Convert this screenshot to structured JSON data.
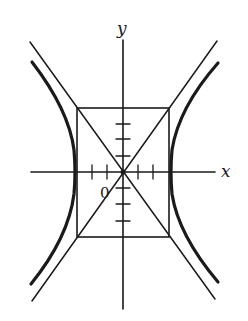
{
  "diagram": {
    "title": "",
    "colors": {
      "stroke": "#1a1a1a",
      "background": "#ffffff"
    },
    "labels": {
      "x_axis": "x",
      "y_axis": "y",
      "origin": "0"
    },
    "origin": {
      "x": 123,
      "y": 172
    },
    "x_axis": {
      "x1": 31,
      "x2": 215,
      "y": 172
    },
    "y_axis": {
      "x": 123,
      "y1": 40,
      "y2": 309
    },
    "x_ticks": [
      92,
      107,
      138,
      153
    ],
    "y_ticks": [
      124,
      139,
      156,
      188,
      204,
      221
    ],
    "rectangle": {
      "x1": 77,
      "y1": 108,
      "x2": 169,
      "y2": 237
    },
    "asymptotes": [
      {
        "x1": 30,
        "y1": 42,
        "x2": 215,
        "y2": 299
      },
      {
        "x1": 217,
        "y1": 41,
        "x2": 32,
        "y2": 301
      }
    ],
    "hyperbola_branches": [
      {
        "side": "left",
        "vertex_x": 75
      },
      {
        "side": "right",
        "vertex_x": 171
      }
    ]
  }
}
